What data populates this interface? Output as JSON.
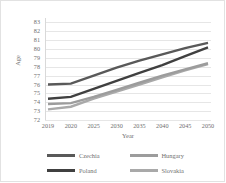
{
  "chart": {
    "type": "line",
    "title": "",
    "xlabel": "Year",
    "ylabel": "Age",
    "grid": true,
    "legend_position": "bottom",
    "ylim": [
      72,
      83.5
    ],
    "yticks": [
      "83",
      "82",
      "81",
      "80",
      "79",
      "78",
      "77",
      "76",
      "75",
      "74",
      "73",
      "72"
    ],
    "categories": [
      "2019",
      "2020",
      "2025",
      "2030",
      "2035",
      "2040",
      "2045",
      "2050"
    ],
    "series": [
      {
        "name": "Czechia",
        "color": "#595959",
        "values": [
          76.0,
          76.1,
          77.0,
          77.9,
          78.7,
          79.4,
          80.1,
          80.7
        ]
      },
      {
        "name": "Hungary",
        "color": "#9c9c9c",
        "values": [
          73.8,
          73.9,
          74.6,
          75.4,
          76.2,
          77.0,
          77.7,
          78.4
        ]
      },
      {
        "name": "Poland",
        "color": "#404040",
        "values": [
          74.4,
          74.6,
          75.5,
          76.4,
          77.3,
          78.2,
          79.2,
          80.2
        ]
      },
      {
        "name": "Slovakia",
        "color": "#a9a9a9",
        "values": [
          73.2,
          73.5,
          74.4,
          75.2,
          76.0,
          76.8,
          77.6,
          78.3
        ]
      }
    ]
  },
  "legend": {
    "items": [
      {
        "label": "Czechia",
        "color": "#595959"
      },
      {
        "label": "Hungary",
        "color": "#9c9c9c"
      },
      {
        "label": "Poland",
        "color": "#404040"
      },
      {
        "label": "Slovakia",
        "color": "#a9a9a9"
      }
    ]
  }
}
